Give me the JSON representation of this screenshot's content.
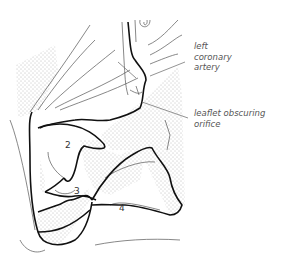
{
  "figure": {
    "type": "anatomical line drawing",
    "callouts": [
      {
        "id": "left-coronary-artery",
        "lines": [
          "left",
          "coronary",
          "artery"
        ]
      },
      {
        "id": "leaflet-obscuring-orifice",
        "lines": [
          "leaflet obscuring",
          "orifice"
        ]
      }
    ],
    "numbers": [
      "2",
      "3",
      "4"
    ]
  }
}
